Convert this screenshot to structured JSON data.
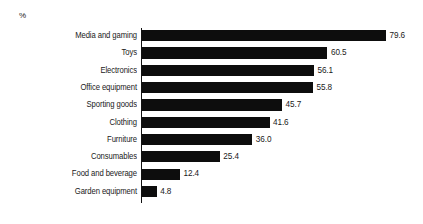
{
  "chart_data": {
    "type": "bar",
    "orientation": "horizontal",
    "title": "",
    "subtitle": "",
    "xlabel": "",
    "ylabel": "",
    "unit_label": "%",
    "grid": false,
    "legend": false,
    "xlim": [
      0,
      79.6
    ],
    "value_format": "one-decimal",
    "categories": [
      "Media and gaming",
      "Toys",
      "Electronics",
      "Office equipment",
      "Sporting goods",
      "Clothing",
      "Furniture",
      "Consumables",
      "Food and beverage",
      "Garden equipment"
    ],
    "values": [
      79.6,
      60.5,
      56.1,
      55.8,
      45.7,
      41.6,
      36.0,
      25.4,
      12.4,
      4.8
    ],
    "value_labels": [
      "79.6",
      "60.5",
      "56.1",
      "55.8",
      "45.7",
      "41.6",
      "36.0",
      "25.4",
      "12.4",
      "4.8"
    ],
    "bar_color": "#0d0d0d",
    "background_color": "#ffffff",
    "axis_color": "#111111",
    "text_color": "#1a1a1a"
  }
}
